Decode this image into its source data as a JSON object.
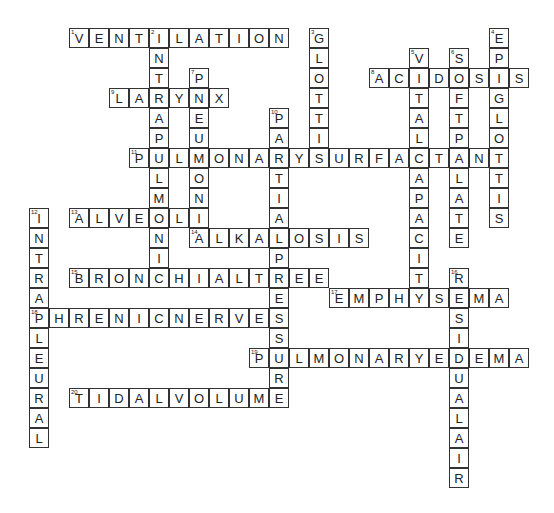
{
  "puzzle": {
    "type": "crossword",
    "cell_size": 20,
    "origin_x": 29,
    "origin_y": 28,
    "words": [
      {
        "number": "1",
        "answer": "VENTILATION",
        "direction": "across",
        "row": 0,
        "col": 2
      },
      {
        "number": "2",
        "answer": "INTRAPULMONIC",
        "direction": "down",
        "row": 0,
        "col": 6
      },
      {
        "number": "3",
        "answer": "GLOTTIS",
        "direction": "down",
        "row": 0,
        "col": 14
      },
      {
        "number": "4",
        "answer": "EPIGLOTTIS",
        "direction": "down",
        "row": 0,
        "col": 23
      },
      {
        "number": "5",
        "answer": "VITALCAPACITY",
        "direction": "down",
        "row": 1,
        "col": 19
      },
      {
        "number": "6",
        "answer": "SOFTPALATE",
        "direction": "down",
        "row": 1,
        "col": 21
      },
      {
        "number": "7",
        "answer": "PNEUMONIA",
        "direction": "down",
        "row": 2,
        "col": 8
      },
      {
        "number": "8",
        "answer": "ACIDOSIS",
        "direction": "across",
        "row": 2,
        "col": 17
      },
      {
        "number": "9",
        "answer": "LARYNX",
        "direction": "across",
        "row": 3,
        "col": 4
      },
      {
        "number": "10",
        "answer": "PARTIALPRESSURE",
        "direction": "down",
        "row": 4,
        "col": 12
      },
      {
        "number": "11",
        "answer": "PULMONARYSURFACTANT",
        "direction": "across",
        "row": 6,
        "col": 5
      },
      {
        "number": "12",
        "answer": "INTRAPLEURAL",
        "direction": "down",
        "row": 9,
        "col": 0
      },
      {
        "number": "13",
        "answer": "ALVEOLI",
        "direction": "across",
        "row": 9,
        "col": 2
      },
      {
        "number": "14",
        "answer": "ALKALOSIS",
        "direction": "across",
        "row": 10,
        "col": 8
      },
      {
        "number": "15",
        "answer": "BRONCHIALTREE",
        "direction": "across",
        "row": 12,
        "col": 2
      },
      {
        "number": "16",
        "answer": "RESIDUALAIR",
        "direction": "down",
        "row": 12,
        "col": 21
      },
      {
        "number": "17",
        "answer": "EMPHYSEMA",
        "direction": "across",
        "row": 13,
        "col": 15
      },
      {
        "number": "18",
        "answer": "PHRENICNERVES",
        "direction": "across",
        "row": 14,
        "col": 0
      },
      {
        "number": "19",
        "answer": "PULMONARYEDEMA",
        "direction": "across",
        "row": 16,
        "col": 11
      },
      {
        "number": "20",
        "answer": "TIDALVOLUME",
        "direction": "across",
        "row": 18,
        "col": 2
      }
    ]
  }
}
